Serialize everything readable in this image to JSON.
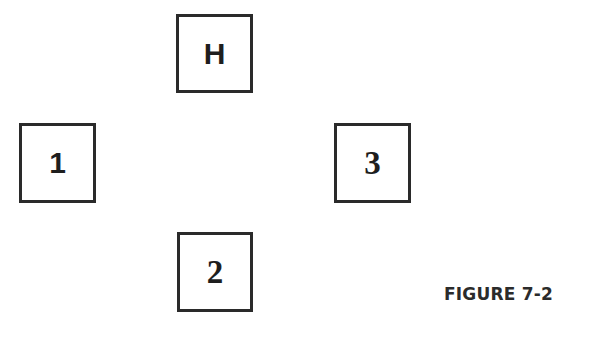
{
  "diagram": {
    "boxes": [
      {
        "id": "H",
        "label": "H",
        "position": "top"
      },
      {
        "id": "1",
        "label": "1",
        "position": "left"
      },
      {
        "id": "3",
        "label": "3",
        "position": "right"
      },
      {
        "id": "2",
        "label": "2",
        "position": "bottom"
      }
    ],
    "caption": "FIGURE 7-2",
    "colors": {
      "border": "#2a2a2a",
      "text": "#1e1e1e",
      "background": "#ffffff"
    }
  }
}
